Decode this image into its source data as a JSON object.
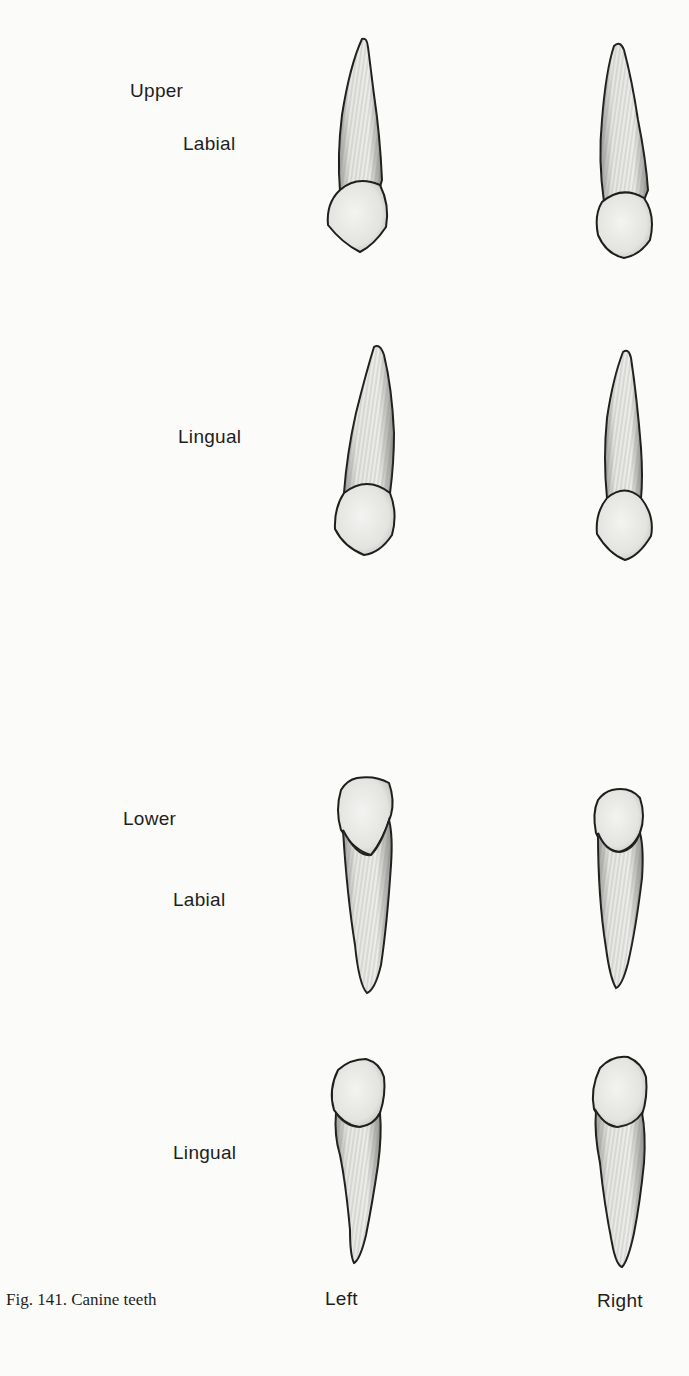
{
  "figure": {
    "caption": "Fig. 141. Canine teeth",
    "columns": {
      "left": "Left",
      "right": "Right"
    },
    "groups": [
      {
        "jaw": "Upper",
        "views": [
          {
            "label": "Labial"
          },
          {
            "label": "Lingual"
          }
        ]
      },
      {
        "jaw": "Lower",
        "views": [
          {
            "label": "Labial"
          },
          {
            "label": "Lingual"
          }
        ]
      }
    ]
  },
  "colors": {
    "ink": "#1e1e1e",
    "paper": "#fbfbf9",
    "shade": "#9a9a9a"
  }
}
